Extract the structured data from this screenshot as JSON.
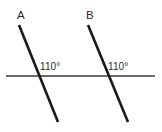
{
  "figure": {
    "background_color": "#ffffff",
    "transversal_color": "#1a1a1a",
    "baseline_color": "#6b6b6b",
    "text_color": "#2a2a2a",
    "labels": {
      "line_a": "A",
      "line_b": "B",
      "angle_a": "110°",
      "angle_b": "110°"
    },
    "geometry": {
      "canvas_width": 162,
      "canvas_height": 132,
      "transversal_a": {
        "x1": 19,
        "y1": 25,
        "x2": 58,
        "y2": 122
      },
      "transversal_b": {
        "x1": 88,
        "y1": 25,
        "x2": 128,
        "y2": 122
      },
      "baseline": {
        "x1": 6,
        "y1": 76,
        "x2": 155,
        "y2": 76
      },
      "intersection_a": {
        "x": 38,
        "y": 76
      },
      "intersection_b": {
        "x": 107,
        "y": 76
      },
      "transversal_stroke_width": 2.6,
      "baseline_stroke_width": 2.0
    }
  },
  "chart_data": {
    "type": "diagram",
    "title": "",
    "elements": [
      {
        "name": "transversal-a",
        "label": "A",
        "kind": "line",
        "x1": 19,
        "y1": 25,
        "x2": 58,
        "y2": 122,
        "color": "#1a1a1a"
      },
      {
        "name": "transversal-b",
        "label": "B",
        "kind": "line",
        "x1": 88,
        "y1": 25,
        "x2": 128,
        "y2": 122,
        "color": "#1a1a1a"
      },
      {
        "name": "baseline",
        "label": "",
        "kind": "line",
        "x1": 6,
        "y1": 76,
        "x2": 155,
        "y2": 76,
        "color": "#6b6b6b"
      }
    ],
    "annotations": [
      {
        "name": "angle-a",
        "text": "110°",
        "x": 40,
        "y": 62
      },
      {
        "name": "angle-b",
        "text": "110°",
        "x": 108,
        "y": 62
      }
    ]
  }
}
